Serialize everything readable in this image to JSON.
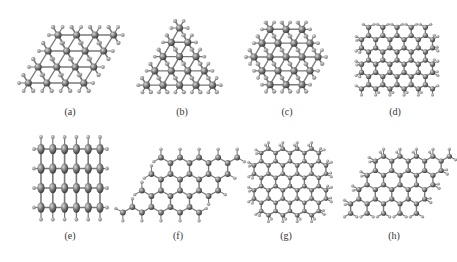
{
  "figure": {
    "colors": {
      "background": "#ffffff",
      "heavy_atom": "#6e6e6e",
      "heavy_atom_highlight": "#c8c8c8",
      "light_atom": "#8a8a8a",
      "bond": "#7a7a7a",
      "label": "#333333"
    },
    "panels": [
      {
        "id": "a",
        "label": "(a)",
        "label_x": 70,
        "label_y": 113,
        "structure": "triangular-lattice-rhombus",
        "shape": "rhombus"
      },
      {
        "id": "b",
        "label": "(b)",
        "label_x": 182,
        "label_y": 113,
        "structure": "triangular-lattice-triangle",
        "shape": "triangle"
      },
      {
        "id": "c",
        "label": "(c)",
        "label_x": 287,
        "label_y": 113,
        "structure": "triangular-lattice-hexagon",
        "shape": "hexagon"
      },
      {
        "id": "d",
        "label": "(d)",
        "label_x": 395,
        "label_y": 113,
        "structure": "honeycomb-square",
        "shape": "square"
      },
      {
        "id": "e",
        "label": "(e)",
        "label_x": 70,
        "label_y": 237,
        "structure": "square-lattice",
        "shape": "square"
      },
      {
        "id": "f",
        "label": "(f)",
        "label_x": 178,
        "label_y": 237,
        "structure": "honeycomb-rhombus",
        "shape": "rhombus"
      },
      {
        "id": "g",
        "label": "(g)",
        "label_x": 286,
        "label_y": 237,
        "structure": "honeycomb-hexagon",
        "shape": "hexagon"
      },
      {
        "id": "h",
        "label": "(h)",
        "label_x": 394,
        "label_y": 237,
        "structure": "honeycomb-rhombus-buckled",
        "shape": "rhombus"
      }
    ]
  }
}
